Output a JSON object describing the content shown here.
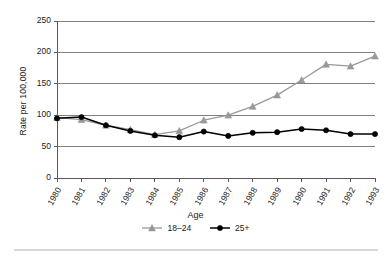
{
  "chart_data": {
    "type": "line",
    "title": "",
    "subtitle": "",
    "xlabel": "",
    "ylabel": "Rate per 100,000",
    "legend_title": "Age",
    "legend_position": "bottom",
    "grid": true,
    "grid_axis": "y",
    "x": [
      1980,
      1981,
      1982,
      1983,
      1984,
      1985,
      1986,
      1987,
      1988,
      1989,
      1990,
      1991,
      1992,
      1993
    ],
    "categories": [
      "1980",
      "1981",
      "1982",
      "1983",
      "1984",
      "1985",
      "1986",
      "1987",
      "1988",
      "1989",
      "1990",
      "1991",
      "1992",
      "1993"
    ],
    "xlim": [
      1980,
      1993
    ],
    "ylim": [
      0,
      250
    ],
    "yticks": [
      0,
      50,
      100,
      150,
      200,
      250
    ],
    "ytick_labels": [
      "0",
      "50",
      "100",
      "150",
      "200",
      "250"
    ],
    "series": [
      {
        "name": "18–24",
        "color": "#999999",
        "marker": "triangle",
        "values": [
          96,
          93,
          84,
          77,
          69,
          75,
          92,
          100,
          114,
          132,
          156,
          181,
          178,
          194
        ]
      },
      {
        "name": "25+",
        "color": "#000000",
        "marker": "circle",
        "values": [
          95,
          97,
          84,
          75,
          68,
          65,
          74,
          67,
          72,
          73,
          78,
          76,
          70,
          70
        ]
      }
    ]
  },
  "axes": {
    "y_title": "Rate per 100,000",
    "y_tick_labels": [
      "250",
      "200",
      "150",
      "100",
      "50",
      "0"
    ],
    "x_tick_labels": [
      "1980",
      "1981",
      "1982",
      "1983",
      "1984",
      "1985",
      "1986",
      "1987",
      "1988",
      "1989",
      "1990",
      "1991",
      "1992",
      "1993"
    ]
  },
  "legend": {
    "title": "Age",
    "entries": [
      {
        "label": "18–24",
        "color": "#999999",
        "marker": "triangle"
      },
      {
        "label": "25+",
        "color": "#000000",
        "marker": "circle"
      }
    ]
  },
  "colors": {
    "series_18_24": "#999999",
    "series_25_plus": "#000000",
    "grid": "#808080",
    "axis": "#5a5a5a",
    "background": "#ffffff",
    "rule": "#d8d8d8"
  }
}
